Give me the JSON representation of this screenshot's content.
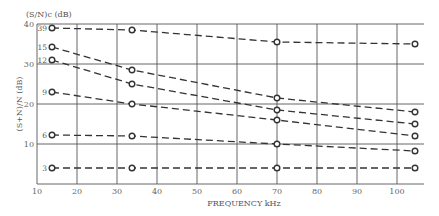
{
  "chart_data": {
    "type": "line",
    "title": "",
    "xlabel": "FREQUENCY kHz",
    "ylabel": "(S+N)/N (dB)",
    "series_label_title": "(S/N)c (dB)",
    "xlim": [
      10,
      105
    ],
    "ylim": [
      0,
      40
    ],
    "x_ticks": [
      10,
      20,
      30,
      40,
      50,
      60,
      70,
      80,
      90,
      100
    ],
    "y_ticks": [
      10,
      20,
      30,
      40
    ],
    "grid": true,
    "legend_position": "inline-left",
    "x": [
      13.75,
      33.75,
      70,
      104.5
    ],
    "series": [
      {
        "name": "39",
        "values": [
          39,
          38.5,
          35.5,
          35
        ]
      },
      {
        "name": "15",
        "values": [
          34.25,
          28.5,
          21.5,
          18
        ]
      },
      {
        "name": "12",
        "values": [
          31,
          25,
          18.5,
          15
        ]
      },
      {
        "name": "9",
        "values": [
          23,
          20,
          16,
          12
        ]
      },
      {
        "name": "6",
        "values": [
          12.25,
          12,
          10,
          8.25
        ]
      },
      {
        "name": "3",
        "values": [
          4,
          4,
          4,
          4
        ]
      }
    ]
  }
}
